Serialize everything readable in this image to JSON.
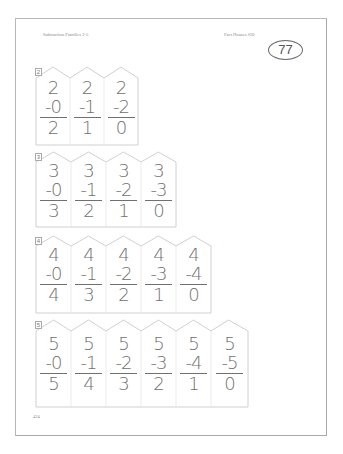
{
  "header": {
    "title": "Subtraction Families 2-5",
    "series": "Fact Houses #20",
    "lesson_number": "77"
  },
  "footer": {
    "page_number": "424"
  },
  "families": [
    {
      "number": "2",
      "problems": [
        {
          "minuend": "2",
          "subtrahend": "-0",
          "difference": "2"
        },
        {
          "minuend": "2",
          "subtrahend": "-1",
          "difference": "1"
        },
        {
          "minuend": "2",
          "subtrahend": "-2",
          "difference": "0"
        }
      ]
    },
    {
      "number": "3",
      "problems": [
        {
          "minuend": "3",
          "subtrahend": "-0",
          "difference": "3"
        },
        {
          "minuend": "3",
          "subtrahend": "-1",
          "difference": "2"
        },
        {
          "minuend": "3",
          "subtrahend": "-2",
          "difference": "1"
        },
        {
          "minuend": "3",
          "subtrahend": "-3",
          "difference": "0"
        }
      ]
    },
    {
      "number": "4",
      "problems": [
        {
          "minuend": "4",
          "subtrahend": "-0",
          "difference": "4"
        },
        {
          "minuend": "4",
          "subtrahend": "-1",
          "difference": "3"
        },
        {
          "minuend": "4",
          "subtrahend": "-2",
          "difference": "2"
        },
        {
          "minuend": "4",
          "subtrahend": "-3",
          "difference": "1"
        },
        {
          "minuend": "4",
          "subtrahend": "-4",
          "difference": "0"
        }
      ]
    },
    {
      "number": "5",
      "problems": [
        {
          "minuend": "5",
          "subtrahend": "-0",
          "difference": "5"
        },
        {
          "minuend": "5",
          "subtrahend": "-1",
          "difference": "4"
        },
        {
          "minuend": "5",
          "subtrahend": "-2",
          "difference": "3"
        },
        {
          "minuend": "5",
          "subtrahend": "-3",
          "difference": "2"
        },
        {
          "minuend": "5",
          "subtrahend": "-4",
          "difference": "1"
        },
        {
          "minuend": "5",
          "subtrahend": "-5",
          "difference": "0"
        }
      ]
    }
  ]
}
